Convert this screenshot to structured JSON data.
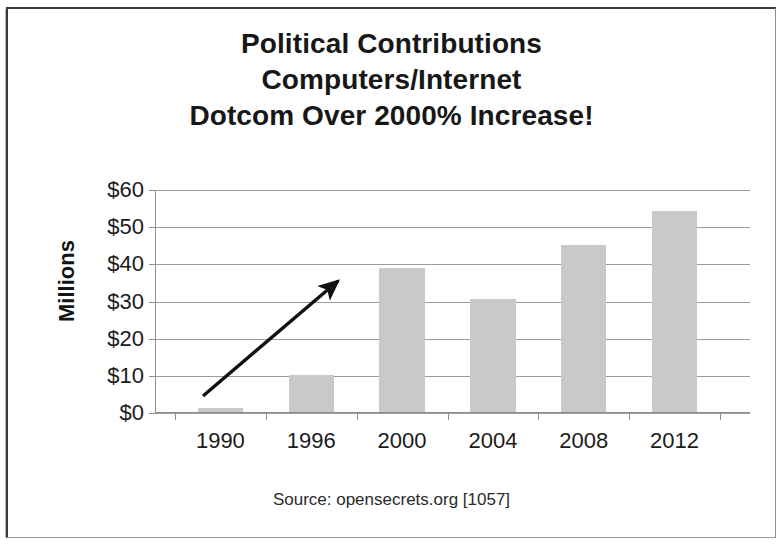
{
  "slide": {
    "title_lines": [
      "Political Contributions",
      "Computers/Internet",
      "Dotcom Over 2000% Increase!"
    ],
    "source_note": "Source: opensecrets.org [1057]",
    "frame_color": "#3a3a3a"
  },
  "chart_data": {
    "type": "bar",
    "title": "Political Contributions Computers/Internet Dotcom Over 2000% Increase!",
    "categories": [
      "1990",
      "1996",
      "2000",
      "2004",
      "2008",
      "2012"
    ],
    "values": [
      1,
      10,
      38.7,
      30.5,
      45,
      54
    ],
    "value_labels": [
      "$1",
      "$10",
      "$38.7",
      "$30.5",
      "$45",
      "$54"
    ],
    "series": [
      {
        "name": "Computers/Internet contributions",
        "values": [
          1,
          10,
          38.7,
          30.5,
          45,
          54
        ]
      }
    ],
    "xlabel": "",
    "ylabel": "Millions",
    "ylim": [
      0,
      60
    ],
    "ytick_values": [
      0,
      10,
      20,
      30,
      40,
      50,
      60
    ],
    "ytick_labels": [
      "$0",
      "$10",
      "$20",
      "$30",
      "$40",
      "$50",
      "$60"
    ],
    "grid": true,
    "legend": "none",
    "bar_color": "#c9c9c9",
    "gridline_color": "#9d9d9d",
    "annotations": [
      {
        "type": "arrow",
        "label": "upward-trend-arrow",
        "from": [
          1990,
          1
        ],
        "to": [
          2000,
          41
        ],
        "color": "#111111"
      }
    ]
  }
}
